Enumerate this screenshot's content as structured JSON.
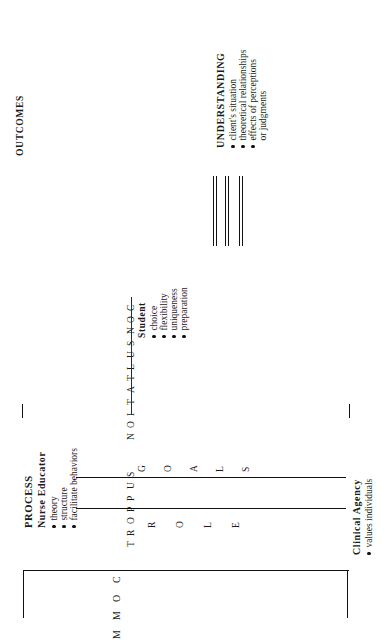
{
  "diagram": {
    "title_outcomes": "OUTCOMES",
    "title_process": "PROCESS",
    "vertical_words": {
      "consultation": "CONSULTATION",
      "support": "SUPPORT",
      "goals": "GOALS",
      "role": "ROLE",
      "communication": "COMMUNICATION"
    },
    "outcomes_block": {
      "heading": "UNDERSTANDING",
      "items": [
        "client's situation",
        "theoretical relationships",
        "effects of perceptions",
        "or judgments"
      ],
      "item_has_bullet": [
        true,
        true,
        true,
        false
      ]
    },
    "student_block": {
      "heading": "Student",
      "items": [
        "choice",
        "flexibility",
        "uniqueness",
        "preparation"
      ],
      "item_has_bullet": [
        true,
        true,
        true,
        true
      ]
    },
    "nurse_educator_block": {
      "heading": "Nurse Educator",
      "items": [
        "theory",
        "structure",
        "facilitate behaviors"
      ],
      "item_has_bullet": [
        true,
        true,
        true
      ]
    },
    "clinical_agency_block": {
      "heading": "Clinical Agency",
      "items": [
        "values individuals"
      ],
      "item_has_bullet": [
        true
      ]
    },
    "connector_bars": {
      "count": 3,
      "description": "three double-line connectors"
    },
    "colors": {
      "ink": "#111111",
      "background": "#ffffff"
    }
  }
}
